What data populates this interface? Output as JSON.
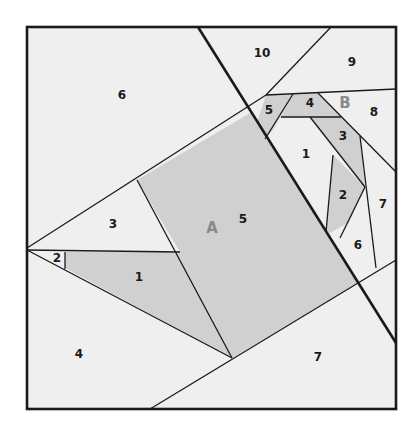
{
  "diagram": {
    "colors": {
      "light": "#efefef",
      "shaded": "#d0d0d0",
      "line": "#1a1a1a",
      "big_label": "#8a8a8a"
    },
    "section_labels": {
      "A": "A",
      "B": "B"
    },
    "section_A": {
      "pieces": [
        {
          "n": "1",
          "shaded": true
        },
        {
          "n": "2",
          "shaded": false
        },
        {
          "n": "3",
          "shaded": false
        },
        {
          "n": "4",
          "shaded": false
        },
        {
          "n": "5",
          "shaded": true
        },
        {
          "n": "6",
          "shaded": false
        },
        {
          "n": "7",
          "shaded": false
        }
      ]
    },
    "section_B": {
      "pieces": [
        {
          "n": "1",
          "shaded": false
        },
        {
          "n": "2",
          "shaded": true
        },
        {
          "n": "3",
          "shaded": true
        },
        {
          "n": "4",
          "shaded": true
        },
        {
          "n": "5",
          "shaded": true
        },
        {
          "n": "6",
          "shaded": false
        },
        {
          "n": "7",
          "shaded": false
        },
        {
          "n": "8",
          "shaded": false
        },
        {
          "n": "9",
          "shaded": false
        },
        {
          "n": "10",
          "shaded": false
        }
      ]
    }
  }
}
